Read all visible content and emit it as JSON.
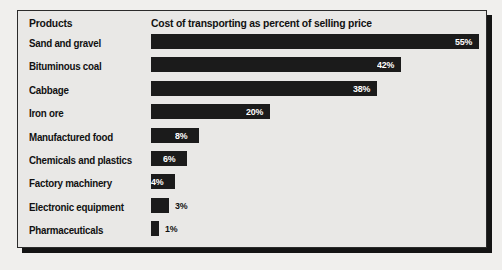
{
  "header": {
    "products_label": "Products",
    "metric_label": "Cost of transporting as percent of selling price"
  },
  "colors": {
    "bar": "#1b1b1b",
    "panel_background": "#e9e8e6",
    "page_background": "#f0efed",
    "border": "#2b2b2b",
    "shadow": "#141414",
    "value_inside": "#ffffff",
    "value_outside": "#111111"
  },
  "chart_data": {
    "type": "bar",
    "orientation": "horizontal",
    "title": "Cost of transporting as percent of selling price",
    "xlabel": "",
    "ylabel": "Products",
    "xlim": [
      0,
      55
    ],
    "grid": false,
    "legend": false,
    "unit": "%",
    "categories": [
      "Sand and gravel",
      "Bituminous coal",
      "Cabbage",
      "Iron ore",
      "Manufactured food",
      "Chemicals and plastics",
      "Factory machinery",
      "Electronic equipment",
      "Pharmaceuticals"
    ],
    "values": [
      55,
      42,
      38,
      20,
      8,
      6,
      4,
      3,
      1
    ],
    "value_labels": [
      "55%",
      "42%",
      "38%",
      "20%",
      "8%",
      "6%",
      "4%",
      "3%",
      "1%"
    ],
    "label_placement": [
      "inside",
      "inside",
      "inside",
      "inside",
      "inside",
      "inside",
      "inside",
      "outside",
      "outside"
    ]
  }
}
